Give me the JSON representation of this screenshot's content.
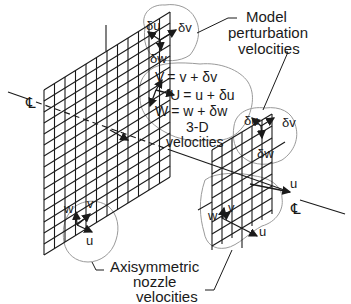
{
  "diagram": {
    "centerline_symbol": "℄",
    "centerline_label": "CL",
    "labels": {
      "model_perturbation": [
        "Model",
        "perturbation",
        "velocities"
      ],
      "axisymmetric": [
        "Axisymmetric",
        "nozzle",
        "velocities"
      ],
      "three_d": [
        "3-D",
        "velocities"
      ]
    },
    "equations": [
      "V = v + δv",
      "U = u + δu",
      "W = w + δw"
    ],
    "equation_symbols": {
      "V": "V",
      "U": "U",
      "W": "W"
    },
    "equation_rhs": [
      "= v + δv",
      "= u + δu",
      "= w + δw"
    ],
    "perturbation_symbols": {
      "du": "δu",
      "dv": "δv",
      "dw": "δw"
    },
    "nozzle_symbols": {
      "u": "u",
      "v": "v",
      "w": "w"
    },
    "colors": {
      "line": "#1a1a1a",
      "cloud": "#9a9a9a",
      "background": "#ffffff"
    }
  }
}
